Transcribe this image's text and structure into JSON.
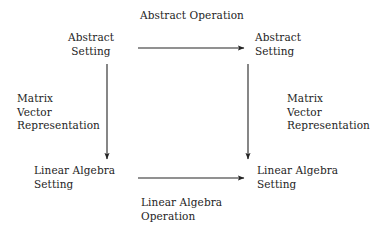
{
  "diagram": {
    "background_color": "#ffffff",
    "ink_color": "#242424",
    "nodes": {
      "top_left": "Abstract\nSetting",
      "top_right": "Abstract\nSetting",
      "bottom_left": "Linear Algebra\nSetting",
      "bottom_right": "Linear Algebra\nSetting"
    },
    "edge_labels": {
      "top": "Abstract Operation",
      "bottom": "Linear Algebra\nOperation",
      "left": "Matrix\nVector\nRepresentation",
      "right": "Matrix\nVector\nRepresentation"
    },
    "arrows": [
      {
        "name": "top-arrow",
        "direction": "right",
        "from": [
          138,
          48
        ],
        "to": [
          245,
          48
        ]
      },
      {
        "name": "bottom-arrow",
        "direction": "right",
        "from": [
          138,
          178
        ],
        "to": [
          245,
          178
        ]
      },
      {
        "name": "left-arrow",
        "direction": "down",
        "from": [
          107,
          64
        ],
        "to": [
          107,
          160
        ]
      },
      {
        "name": "right-arrow",
        "direction": "down",
        "from": [
          248,
          64
        ],
        "to": [
          248,
          160
        ]
      }
    ]
  }
}
